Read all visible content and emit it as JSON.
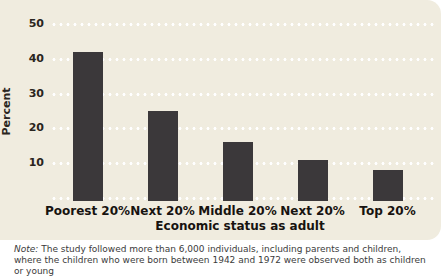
{
  "chart_data": {
    "type": "bar",
    "title": "",
    "categories": [
      "Poorest 20%",
      "Next 20%",
      "Middle 20%",
      "Next 20%",
      "Top 20%"
    ],
    "values": [
      42,
      25,
      16,
      11,
      8
    ],
    "xlabel": "Economic status as adult",
    "ylabel": "Percent",
    "ylim": [
      0,
      50
    ],
    "yticks": [
      10,
      20,
      30,
      40,
      50
    ],
    "grid": "horizontal-dotted-white",
    "legend": "none",
    "bar_color": "#3b383a",
    "panel_background": "#f0ecdf"
  },
  "note": {
    "label": "Note:",
    "text": "The study followed more than 6,000 individuals, including parents and children, where the children who were born between 1942 and 1972 were observed both as children or young"
  }
}
